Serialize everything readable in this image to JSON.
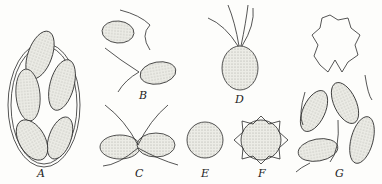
{
  "figure": {
    "colors": {
      "ink": "#2a2a2a",
      "stipple": "#e2e2dc",
      "background": "#fdfdfb"
    },
    "panels": [
      {
        "id": "A",
        "label": "A",
        "subject": "cyst containing multiple cells",
        "label_x": 37,
        "label_y": 168
      },
      {
        "id": "B",
        "label": "B",
        "subject": "two biflagellate cells",
        "label_x": 139,
        "label_y": 90
      },
      {
        "id": "C",
        "label": "C",
        "subject": "dividing cell pair",
        "label_x": 135,
        "label_y": 168
      },
      {
        "id": "D",
        "label": "D",
        "subject": "cell with four flagella",
        "label_x": 235,
        "label_y": 94
      },
      {
        "id": "E",
        "label": "E",
        "subject": "round cell",
        "label_x": 201,
        "label_y": 168
      },
      {
        "id": "F",
        "label": "F",
        "subject": "spiny cyst",
        "label_x": 258,
        "label_y": 168
      },
      {
        "id": "G",
        "label": "G",
        "subject": "empty spiny cyst and released cells",
        "label_x": 335,
        "label_y": 168
      }
    ]
  }
}
